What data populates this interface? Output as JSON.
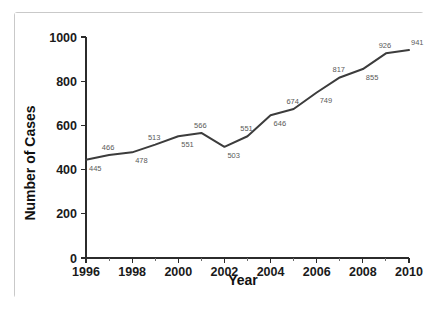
{
  "chart_data": {
    "type": "line",
    "title": "",
    "xlabel": "Year",
    "ylabel": "Number of Cases",
    "x": [
      1996,
      1997,
      1998,
      1999,
      2000,
      2001,
      2002,
      2003,
      2004,
      2005,
      2006,
      2007,
      2008,
      2009,
      2010
    ],
    "values": [
      445,
      466,
      478,
      513,
      551,
      566,
      503,
      551,
      646,
      674,
      749,
      817,
      855,
      926,
      941
    ],
    "categories": [
      "1996",
      "1997",
      "1998",
      "1999",
      "2000",
      "2001",
      "2002",
      "2003",
      "2004",
      "2005",
      "2006",
      "2007",
      "2008",
      "2009",
      "2010"
    ],
    "point_labels": [
      "445",
      "466",
      "478",
      "513",
      "551",
      "566",
      "503",
      "551",
      "646",
      "674",
      "749",
      "817",
      "855",
      "926",
      "941"
    ],
    "point_label_positions": [
      "below",
      "above",
      "below",
      "above",
      "below",
      "above",
      "below",
      "above",
      "below",
      "above",
      "below",
      "above",
      "below",
      "above",
      "above"
    ],
    "series": [
      {
        "name": "Number of Cases",
        "values": [
          445,
          466,
          478,
          513,
          551,
          566,
          503,
          551,
          646,
          674,
          749,
          817,
          855,
          926,
          941
        ],
        "color": "#3c3c3c"
      }
    ],
    "xlim": [
      1996,
      2010
    ],
    "ylim": [
      0,
      1000
    ],
    "x_tick_labels": [
      "1996",
      "1998",
      "2000",
      "2002",
      "2004",
      "2006",
      "2008",
      "2010"
    ],
    "x_tick_values": [
      1996,
      1998,
      2000,
      2002,
      2004,
      2006,
      2008,
      2010
    ],
    "x_minor_tick_values": [
      1997,
      1999,
      2001,
      2003,
      2005,
      2007,
      2009
    ],
    "y_tick_labels": [
      "0",
      "200",
      "400",
      "600",
      "800",
      "1000"
    ],
    "y_tick_values": [
      0,
      200,
      400,
      600,
      800,
      1000
    ],
    "grid": false,
    "legend": false,
    "legend_position": "none",
    "line_color": "#3c3c3c",
    "axis_color": "#2b2b2b",
    "label_color": "#5a5a5a",
    "background_color": "#ffffff",
    "border_color": "#c9c9c9"
  }
}
